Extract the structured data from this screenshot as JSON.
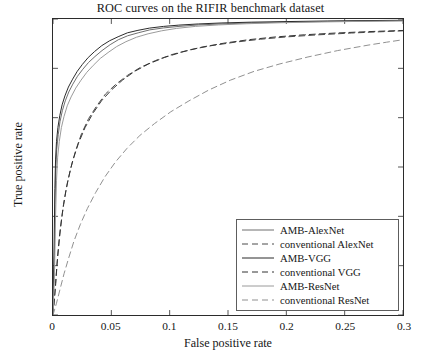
{
  "chart_data": {
    "type": "line",
    "title": "ROC curves on the RIFIR benchmark dataset",
    "xlabel": "False positive rate",
    "ylabel": "True positive rate",
    "xlim": [
      0,
      0.3
    ],
    "ylim": [
      0.7,
      1
    ],
    "xticks": [
      "0",
      "0.05",
      "0.1",
      "0.15",
      "0.2",
      "0.25",
      "0.3"
    ],
    "xtick_values": [
      0,
      0.05,
      0.1,
      0.15,
      0.2,
      0.25,
      0.3
    ],
    "yticks": [
      "0.7",
      "0.75",
      "0.8",
      "0.85",
      "0.9",
      "0.95",
      "1"
    ],
    "ytick_values": [
      0.7,
      0.75,
      0.8,
      0.85,
      0.9,
      0.95,
      1
    ],
    "grid": false,
    "legend_position": "lower right",
    "series": [
      {
        "name": "AMB-AlexNet",
        "style": "solid",
        "color": "#6e6e6e",
        "width": 1.0,
        "points": [
          [
            0.0,
            0.7
          ],
          [
            0.0012,
            0.76
          ],
          [
            0.0018,
            0.812
          ],
          [
            0.0024,
            0.846
          ],
          [
            0.0032,
            0.868
          ],
          [
            0.0045,
            0.883
          ],
          [
            0.006,
            0.896
          ],
          [
            0.008,
            0.907
          ],
          [
            0.0105,
            0.917
          ],
          [
            0.0135,
            0.926
          ],
          [
            0.017,
            0.934
          ],
          [
            0.021,
            0.942
          ],
          [
            0.0255,
            0.949
          ],
          [
            0.0305,
            0.956
          ],
          [
            0.036,
            0.962
          ],
          [
            0.042,
            0.968
          ],
          [
            0.049,
            0.974
          ],
          [
            0.056,
            0.979
          ],
          [
            0.064,
            0.983
          ],
          [
            0.073,
            0.986
          ],
          [
            0.083,
            0.989
          ],
          [
            0.095,
            0.991
          ],
          [
            0.108,
            0.9925
          ],
          [
            0.125,
            0.994
          ],
          [
            0.145,
            0.995
          ],
          [
            0.17,
            0.996
          ],
          [
            0.2,
            0.9968
          ],
          [
            0.235,
            0.9975
          ],
          [
            0.27,
            0.998
          ],
          [
            0.3,
            0.9984
          ]
        ]
      },
      {
        "name": "conventional AlexNet",
        "style": "dashed",
        "color": "#4a4a4a",
        "width": 1.0,
        "points": [
          [
            0.0,
            0.7
          ],
          [
            0.002,
            0.726
          ],
          [
            0.0035,
            0.752
          ],
          [
            0.0055,
            0.778
          ],
          [
            0.008,
            0.803
          ],
          [
            0.011,
            0.826
          ],
          [
            0.015,
            0.848
          ],
          [
            0.0195,
            0.867
          ],
          [
            0.0245,
            0.884
          ],
          [
            0.0305,
            0.899
          ],
          [
            0.0375,
            0.912
          ],
          [
            0.045,
            0.924
          ],
          [
            0.054,
            0.934
          ],
          [
            0.064,
            0.943
          ],
          [
            0.075,
            0.951
          ],
          [
            0.088,
            0.958
          ],
          [
            0.102,
            0.964
          ],
          [
            0.118,
            0.969
          ],
          [
            0.136,
            0.973
          ],
          [
            0.156,
            0.9765
          ],
          [
            0.178,
            0.9795
          ],
          [
            0.202,
            0.982
          ],
          [
            0.228,
            0.984
          ],
          [
            0.256,
            0.9858
          ],
          [
            0.28,
            0.987
          ],
          [
            0.3,
            0.988
          ]
        ]
      },
      {
        "name": "AMB-VGG",
        "style": "solid",
        "color": "#2a2a2a",
        "width": 1.0,
        "points": [
          [
            0.0,
            0.7
          ],
          [
            0.001,
            0.775
          ],
          [
            0.0016,
            0.828
          ],
          [
            0.0022,
            0.858
          ],
          [
            0.003,
            0.876
          ],
          [
            0.0042,
            0.89
          ],
          [
            0.0058,
            0.902
          ],
          [
            0.0078,
            0.913
          ],
          [
            0.0102,
            0.922
          ],
          [
            0.0132,
            0.931
          ],
          [
            0.0168,
            0.939
          ],
          [
            0.0208,
            0.947
          ],
          [
            0.0252,
            0.954
          ],
          [
            0.0302,
            0.961
          ],
          [
            0.0356,
            0.967
          ],
          [
            0.0418,
            0.973
          ],
          [
            0.0486,
            0.978
          ],
          [
            0.0558,
            0.982
          ],
          [
            0.0638,
            0.986
          ],
          [
            0.0728,
            0.9885
          ],
          [
            0.0828,
            0.9908
          ],
          [
            0.0948,
            0.9925
          ],
          [
            0.1078,
            0.9938
          ],
          [
            0.1248,
            0.995
          ],
          [
            0.1448,
            0.996
          ],
          [
            0.1698,
            0.9968
          ],
          [
            0.2,
            0.9974
          ],
          [
            0.235,
            0.998
          ],
          [
            0.27,
            0.9984
          ],
          [
            0.3,
            0.9987
          ]
        ]
      },
      {
        "name": "conventional VGG",
        "style": "dashed",
        "color": "#333333",
        "width": 1.0,
        "points": [
          [
            0.0,
            0.7
          ],
          [
            0.0022,
            0.732
          ],
          [
            0.004,
            0.76
          ],
          [
            0.0062,
            0.787
          ],
          [
            0.009,
            0.812
          ],
          [
            0.0125,
            0.835
          ],
          [
            0.0168,
            0.856
          ],
          [
            0.0218,
            0.874
          ],
          [
            0.0275,
            0.89
          ],
          [
            0.034,
            0.904
          ],
          [
            0.0415,
            0.917
          ],
          [
            0.05,
            0.928
          ],
          [
            0.0595,
            0.938
          ],
          [
            0.07,
            0.947
          ],
          [
            0.082,
            0.9545
          ],
          [
            0.0955,
            0.961
          ],
          [
            0.1105,
            0.9665
          ],
          [
            0.1275,
            0.9715
          ],
          [
            0.1465,
            0.9755
          ],
          [
            0.1675,
            0.979
          ],
          [
            0.1905,
            0.9818
          ],
          [
            0.2155,
            0.984
          ],
          [
            0.2425,
            0.9858
          ],
          [
            0.27,
            0.9872
          ],
          [
            0.3,
            0.9884
          ]
        ]
      },
      {
        "name": "AMB-ResNet",
        "style": "solid",
        "color": "#9a9a9a",
        "width": 1.0,
        "points": [
          [
            0.0,
            0.7
          ],
          [
            0.0014,
            0.748
          ],
          [
            0.0022,
            0.8
          ],
          [
            0.003,
            0.836
          ],
          [
            0.004,
            0.86
          ],
          [
            0.0054,
            0.876
          ],
          [
            0.0072,
            0.89
          ],
          [
            0.0094,
            0.901
          ],
          [
            0.0122,
            0.912
          ],
          [
            0.0155,
            0.921
          ],
          [
            0.0195,
            0.93
          ],
          [
            0.024,
            0.938
          ],
          [
            0.029,
            0.946
          ],
          [
            0.0345,
            0.953
          ],
          [
            0.0405,
            0.96
          ],
          [
            0.0472,
            0.966
          ],
          [
            0.0545,
            0.972
          ],
          [
            0.0625,
            0.977
          ],
          [
            0.0715,
            0.9815
          ],
          [
            0.0815,
            0.985
          ],
          [
            0.093,
            0.988
          ],
          [
            0.106,
            0.9905
          ],
          [
            0.122,
            0.9925
          ],
          [
            0.142,
            0.994
          ],
          [
            0.166,
            0.9952
          ],
          [
            0.195,
            0.9962
          ],
          [
            0.23,
            0.997
          ],
          [
            0.265,
            0.9976
          ],
          [
            0.3,
            0.998
          ]
        ]
      },
      {
        "name": "conventional ResNet",
        "style": "dashed",
        "color": "#8f8f8f",
        "width": 1.0,
        "points": [
          [
            0.0,
            0.7
          ],
          [
            0.003,
            0.712
          ],
          [
            0.006,
            0.726
          ],
          [
            0.0095,
            0.742
          ],
          [
            0.0135,
            0.758
          ],
          [
            0.018,
            0.775
          ],
          [
            0.0235,
            0.792
          ],
          [
            0.0295,
            0.808
          ],
          [
            0.0365,
            0.824
          ],
          [
            0.0445,
            0.84
          ],
          [
            0.0535,
            0.855
          ],
          [
            0.0635,
            0.869
          ],
          [
            0.0745,
            0.882
          ],
          [
            0.087,
            0.894
          ],
          [
            0.101,
            0.906
          ],
          [
            0.1165,
            0.917
          ],
          [
            0.1335,
            0.928
          ],
          [
            0.152,
            0.938
          ],
          [
            0.1725,
            0.947
          ],
          [
            0.1945,
            0.9545
          ],
          [
            0.2185,
            0.9615
          ],
          [
            0.244,
            0.968
          ],
          [
            0.27,
            0.9735
          ],
          [
            0.286,
            0.9765
          ],
          [
            0.3,
            0.979
          ]
        ]
      }
    ]
  },
  "legend": {
    "items": [
      {
        "label": "AMB-AlexNet"
      },
      {
        "label": "conventional AlexNet"
      },
      {
        "label": "AMB-VGG"
      },
      {
        "label": "conventional VGG"
      },
      {
        "label": "AMB-ResNet"
      },
      {
        "label": "conventional ResNet"
      }
    ]
  }
}
